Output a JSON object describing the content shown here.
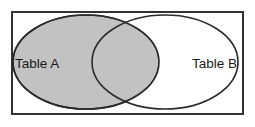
{
  "figure": {
    "type": "venn-diagram",
    "title": "",
    "background_color": "#ffffff",
    "frame": {
      "name": "outer-rectangle",
      "stroke_color": "#333333",
      "stroke_width": 2,
      "fill": "#ffffff",
      "x": 12,
      "y": 12,
      "width": 231,
      "height": 102
    },
    "sets": [
      {
        "id": "table-a",
        "label": "Table A",
        "shape": "ellipse",
        "fill_color": "#c2c2c2",
        "fill_state": "shaded",
        "stroke_color": "#2b2b2b",
        "stroke_width": 1.6,
        "cx": 86,
        "cy": 62,
        "rx": 73,
        "ry": 47,
        "label_x": 15,
        "label_y": 64,
        "label_anchor": "start",
        "label_color": "#1a1a1a"
      },
      {
        "id": "table-b",
        "label": "Table B",
        "shape": "ellipse",
        "fill_color": "#ffffff",
        "fill_state": "unshaded",
        "stroke_color": "#2b2b2b",
        "stroke_width": 1.6,
        "cx": 165,
        "cy": 62,
        "rx": 73,
        "ry": 47,
        "label_x": 237,
        "label_y": 64,
        "label_anchor": "end",
        "label_color": "#1a1a1a"
      }
    ],
    "intersection": {
      "id": "a-intersect-b",
      "fill_color": "#c2c2c2",
      "fill_state": "shaded",
      "label": ""
    }
  }
}
